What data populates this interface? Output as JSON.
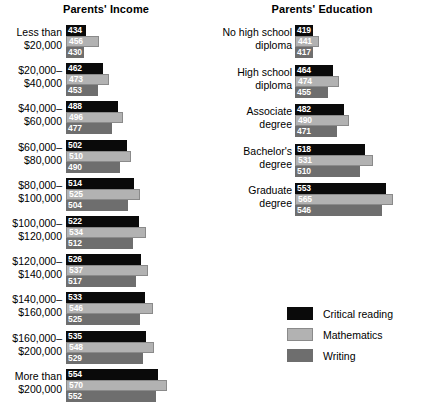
{
  "chart_data": {
    "type": "bar",
    "title": "",
    "orientation": "horizontal",
    "xlabel": "",
    "ylabel": "",
    "xlim": [
      400,
      600
    ],
    "grid": false,
    "legend_position": "bottom-right",
    "legend": [
      "Critical reading",
      "Mathematics",
      "Writing"
    ],
    "series": [
      {
        "name": "Critical reading",
        "color": "#0a0a0a",
        "values": [
          434,
          462,
          488,
          502,
          514,
          522,
          526,
          533,
          535,
          554,
          419,
          464,
          482,
          518,
          553
        ]
      },
      {
        "name": "Mathematics",
        "color": "#b2b2b2",
        "values": [
          456,
          473,
          496,
          510,
          525,
          534,
          537,
          546,
          548,
          570,
          441,
          474,
          490,
          531,
          565
        ]
      },
      {
        "name": "Writing",
        "color": "#6e6e6e",
        "values": [
          430,
          453,
          477,
          490,
          504,
          512,
          517,
          525,
          529,
          552,
          417,
          455,
          471,
          510,
          546
        ]
      }
    ],
    "panels": [
      {
        "id": "income",
        "title": "Parents' Income",
        "categories": [
          "Less than\n$20,000",
          "$20,000–\n$40,000",
          "$40,000–\n$60,000",
          "$60,000–\n$80,000",
          "$80,000–\n$100,000",
          "$100,000–\n$120,000",
          "$120,000–\n$140,000",
          "$140,000–\n$160,000",
          "$160,000–\n$200,000",
          "More than\n$200,000"
        ],
        "rows": [
          {
            "label": "Less than\n$20,000",
            "critical_reading": 434,
            "mathematics": 456,
            "writing": 430
          },
          {
            "label": "$20,000–\n$40,000",
            "critical_reading": 462,
            "mathematics": 473,
            "writing": 453
          },
          {
            "label": "$40,000–\n$60,000",
            "critical_reading": 488,
            "mathematics": 496,
            "writing": 477
          },
          {
            "label": "$60,000–\n$80,000",
            "critical_reading": 502,
            "mathematics": 510,
            "writing": 490
          },
          {
            "label": "$80,000–\n$100,000",
            "critical_reading": 514,
            "mathematics": 525,
            "writing": 504
          },
          {
            "label": "$100,000–\n$120,000",
            "critical_reading": 522,
            "mathematics": 534,
            "writing": 512
          },
          {
            "label": "$120,000–\n$140,000",
            "critical_reading": 526,
            "mathematics": 537,
            "writing": 517
          },
          {
            "label": "$140,000–\n$160,000",
            "critical_reading": 533,
            "mathematics": 546,
            "writing": 525
          },
          {
            "label": "$160,000–\n$200,000",
            "critical_reading": 535,
            "mathematics": 548,
            "writing": 529
          },
          {
            "label": "More than\n$200,000",
            "critical_reading": 554,
            "mathematics": 570,
            "writing": 552
          }
        ]
      },
      {
        "id": "education",
        "title": "Parents' Education",
        "categories": [
          "No high school\ndiploma",
          "High school\ndiploma",
          "Associate\ndegree",
          "Bachelor's\ndegree",
          "Graduate\ndegree"
        ],
        "rows": [
          {
            "label": "No high school\ndiploma",
            "critical_reading": 419,
            "mathematics": 441,
            "writing": 417
          },
          {
            "label": "High school\ndiploma",
            "critical_reading": 464,
            "mathematics": 474,
            "writing": 455
          },
          {
            "label": "Associate\ndegree",
            "critical_reading": 482,
            "mathematics": 490,
            "writing": 471
          },
          {
            "label": "Bachelor's\ndegree",
            "critical_reading": 518,
            "mathematics": 531,
            "writing": 510
          },
          {
            "label": "Graduate\ndegree",
            "critical_reading": 553,
            "mathematics": 565,
            "writing": 546
          }
        ]
      }
    ]
  },
  "legend": {
    "items": [
      {
        "label": "Critical reading",
        "color": "#0a0a0a"
      },
      {
        "label": "Mathematics",
        "color": "#b2b2b2"
      },
      {
        "label": "Writing",
        "color": "#6e6e6e"
      }
    ]
  }
}
